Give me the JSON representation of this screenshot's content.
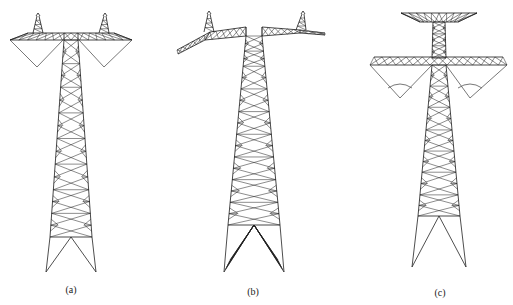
{
  "figure": {
    "panels": [
      {
        "id": "a",
        "label": "(a)",
        "type": "horizontal crossarm with V-string insulators and two earth-wire peaks"
      },
      {
        "id": "b",
        "label": "(b)",
        "type": "cat-head style sloped crossarm with two earth-wire peaks"
      },
      {
        "id": "c",
        "label": "(c)",
        "type": "double-level crossarm with top earth-wire arm and V-string insulators"
      }
    ],
    "colors": {
      "line": "#1a1a1a",
      "insulator": "#555555",
      "background": "#ffffff"
    }
  }
}
